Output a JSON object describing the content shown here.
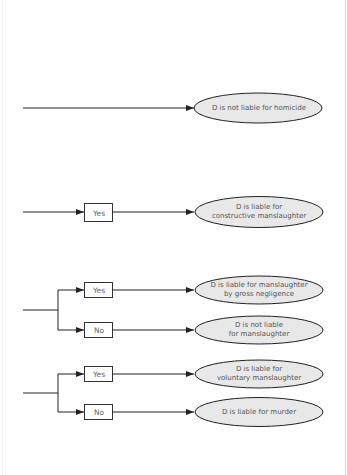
{
  "diagram": {
    "colors": {
      "line": "#222222",
      "ellipse_fill": "#e8e8e8",
      "ellipse_stroke": "#222222",
      "box_fill": "#ffffff",
      "box_stroke": "#333333",
      "text": "#555555"
    },
    "rows": [
      {
        "outcome": "D is not liable for homicide"
      },
      {
        "decision": "Yes",
        "outcome_line1": "D is liable for",
        "outcome_line2": "constructive manslaughter"
      },
      {
        "yes": {
          "decision": "Yes",
          "outcome_line1": "D is liable for manslaughter",
          "outcome_line2": "by gross negligence"
        },
        "no": {
          "decision": "No",
          "outcome_line1": "D is not liable",
          "outcome_line2": "for manslaughter"
        }
      },
      {
        "yes": {
          "decision": "Yes",
          "outcome_line1": "D is liable for",
          "outcome_line2": "voluntary manslaughter"
        },
        "no": {
          "decision": "No",
          "outcome": "D is liable for murder"
        }
      }
    ]
  }
}
